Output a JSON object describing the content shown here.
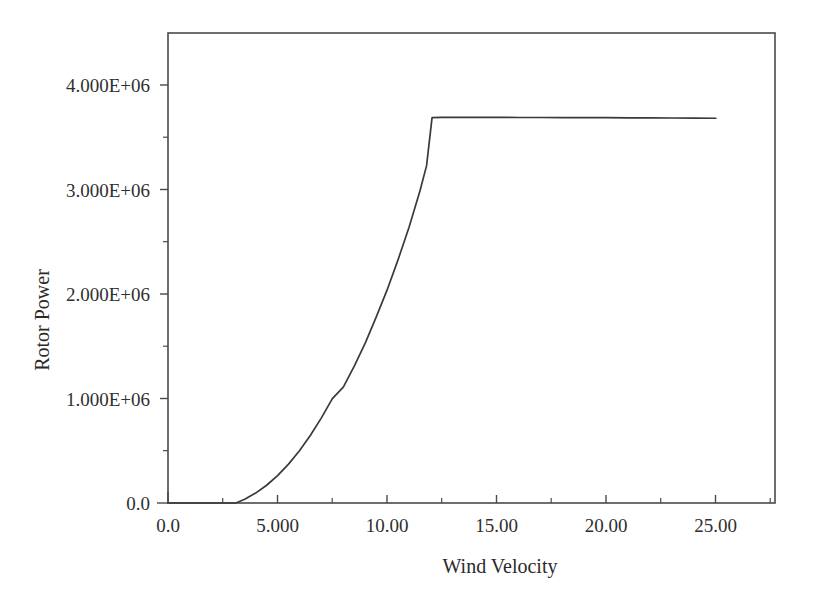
{
  "figure": {
    "background_color": "#ffffff",
    "line_color": "#3a3a3a",
    "axis_color": "#4a4a4a",
    "text_color": "#2b2b2b"
  },
  "chart_data": {
    "type": "line",
    "title": "",
    "xlabel": "Wind Velocity",
    "ylabel": "Rotor Power",
    "xlim": [
      0,
      27.7
    ],
    "ylim": [
      0,
      4500000
    ],
    "grid": false,
    "legend": null,
    "x_tick_labels": [
      "0.0",
      "5.000",
      "10.00",
      "15.00",
      "20.00",
      "25.00"
    ],
    "x_tick_values": [
      0,
      5,
      10,
      15,
      20,
      25
    ],
    "x_minor_tick_values": [
      2.5,
      7.5,
      12.5,
      17.5,
      22.5
    ],
    "y_tick_labels": [
      "0.0",
      "1.000E+06",
      "2.000E+06",
      "3.000E+06",
      "4.000E+06"
    ],
    "y_tick_values": [
      0,
      1000000,
      2000000,
      3000000,
      4000000
    ],
    "y_minor_tick_values": [
      500000,
      1500000,
      2500000,
      3500000
    ],
    "series": [
      {
        "name": "Rotor Power",
        "x": [
          0,
          0.5,
          1,
          1.5,
          2,
          2.5,
          3,
          3.1,
          3.5,
          4,
          4.5,
          5,
          5.5,
          6,
          6.5,
          7,
          7.5,
          8,
          8.5,
          9,
          9.5,
          10,
          10.5,
          11,
          11.5,
          11.8,
          12.05,
          12.5,
          13,
          14,
          15,
          16,
          17,
          18,
          19,
          20,
          21,
          22,
          23,
          24,
          25
        ],
        "y": [
          0,
          0,
          0,
          0,
          0,
          0,
          0,
          0,
          36000,
          95000,
          170000,
          262000,
          372000,
          500000,
          648000,
          815000,
          1000000,
          1110000,
          1310000,
          1530000,
          1780000,
          2040000,
          2330000,
          2640000,
          2990000,
          3230000,
          3690000,
          3692000,
          3693000,
          3693000,
          3692000,
          3691000,
          3691000,
          3690000,
          3690000,
          3689000,
          3688000,
          3687000,
          3686000,
          3685000,
          3684000
        ]
      }
    ],
    "annotations": {
      "cut_in_speed": 3.1,
      "rated_speed": 12.05,
      "rated_power": 3690000,
      "cut_out_speed": 25
    }
  }
}
